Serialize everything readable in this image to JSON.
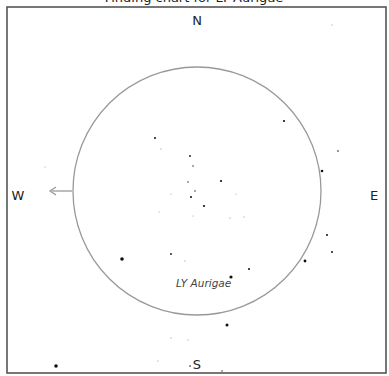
{
  "chart": {
    "title_fragment": "Finding chart for LY Aurigae",
    "frame": {
      "x": 7,
      "y": 7,
      "width": 379,
      "height": 366,
      "color": "#555555"
    },
    "field_circle": {
      "cx": 197,
      "cy": 191,
      "r": 124,
      "color": "#999999"
    },
    "directions": {
      "north": "N",
      "south": "S",
      "east": "E",
      "west": "W"
    },
    "direction_positions": {
      "north": {
        "x": 197,
        "y": 25
      },
      "south": {
        "x": 197,
        "y": 369
      },
      "east": {
        "x": 374,
        "y": 200
      },
      "west": {
        "x": 18,
        "y": 200
      }
    },
    "arrow": {
      "from": [
        72,
        191
      ],
      "to": [
        50,
        191
      ],
      "color": "#999999"
    },
    "target_label": "LY Aurigae",
    "target_label_pos": {
      "x": 176,
      "y": 287
    },
    "stars": [
      {
        "x": 332,
        "y": 25,
        "r": 0.6
      },
      {
        "x": 284,
        "y": 121,
        "r": 1.1
      },
      {
        "x": 338,
        "y": 151,
        "r": 0.8
      },
      {
        "x": 322,
        "y": 171,
        "r": 1.3
      },
      {
        "x": 327,
        "y": 235,
        "r": 1.0
      },
      {
        "x": 332,
        "y": 252,
        "r": 1.0
      },
      {
        "x": 305,
        "y": 261,
        "r": 1.4
      },
      {
        "x": 45,
        "y": 167,
        "r": 0.5
      },
      {
        "x": 155,
        "y": 138,
        "r": 1.0
      },
      {
        "x": 161,
        "y": 149,
        "r": 0.6
      },
      {
        "x": 190,
        "y": 156,
        "r": 0.9
      },
      {
        "x": 193,
        "y": 166,
        "r": 0.7
      },
      {
        "x": 188,
        "y": 182,
        "r": 0.7
      },
      {
        "x": 221,
        "y": 181,
        "r": 1.1
      },
      {
        "x": 195,
        "y": 191,
        "r": 0.7
      },
      {
        "x": 171,
        "y": 194,
        "r": 0.5
      },
      {
        "x": 191,
        "y": 197,
        "r": 1.0
      },
      {
        "x": 236,
        "y": 194,
        "r": 0.5
      },
      {
        "x": 204,
        "y": 206,
        "r": 1.1
      },
      {
        "x": 159,
        "y": 212,
        "r": 0.5
      },
      {
        "x": 193,
        "y": 216,
        "r": 0.5
      },
      {
        "x": 230,
        "y": 218,
        "r": 0.6
      },
      {
        "x": 244,
        "y": 217,
        "r": 0.6
      },
      {
        "x": 171,
        "y": 254,
        "r": 0.9
      },
      {
        "x": 185,
        "y": 261,
        "r": 0.6
      },
      {
        "x": 249,
        "y": 269,
        "r": 1.0
      },
      {
        "x": 231,
        "y": 277,
        "r": 1.6
      },
      {
        "x": 122,
        "y": 259,
        "r": 1.8
      },
      {
        "x": 227,
        "y": 325,
        "r": 1.5
      },
      {
        "x": 171,
        "y": 338,
        "r": 0.6
      },
      {
        "x": 188,
        "y": 340,
        "r": 0.6
      },
      {
        "x": 158,
        "y": 361,
        "r": 0.6
      },
      {
        "x": 190,
        "y": 366,
        "r": 0.8
      },
      {
        "x": 222,
        "y": 371,
        "r": 0.7
      },
      {
        "x": 56,
        "y": 366,
        "r": 1.8
      }
    ]
  }
}
